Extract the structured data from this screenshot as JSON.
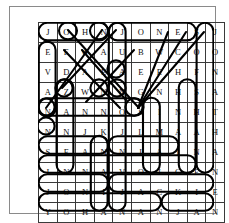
{
  "puzzle": {
    "title": "Word Search Puzzle",
    "rows": 10,
    "cols": 10,
    "grid": [
      [
        "J",
        "O",
        "H",
        "N",
        "J",
        "O",
        "N",
        "E",
        "S",
        "J"
      ],
      [
        "E",
        "E",
        "W",
        "A",
        "U",
        "B",
        "W",
        "C",
        "O",
        "O"
      ],
      [
        "V",
        "D",
        "A",
        "E",
        "A",
        "E",
        "E",
        "H",
        "F",
        "N"
      ],
      [
        "A",
        "Z",
        "W",
        "N",
        "N",
        "G",
        "N",
        "H",
        "S",
        "A"
      ],
      [
        "N",
        "A",
        "N",
        "N",
        "O",
        "S",
        "I",
        "N",
        "H",
        "T"
      ],
      [
        "N",
        "N",
        "J",
        "K",
        "J",
        "L",
        "M",
        "A",
        "A",
        "H"
      ],
      [
        "S",
        "E",
        "A",
        "N",
        "N",
        "I",
        "A",
        "I",
        "N",
        "A"
      ],
      [
        "I",
        "N",
        "N",
        "A",
        "V",
        "O",
        "I",
        "G",
        "E",
        "N"
      ],
      [
        "J",
        "O",
        "N",
        "I",
        "J",
        "A",
        "C",
        "K",
        "I",
        "E"
      ],
      [
        "Y",
        "O",
        "H",
        "A",
        "N",
        "A",
        "N",
        "J",
        "A",
        "N"
      ]
    ],
    "found_words": [
      {
        "word": "JOHN",
        "direction": "horizontal",
        "start_row": 0,
        "start_col": 0,
        "end_row": 0,
        "end_col": 3
      },
      {
        "word": "JONES",
        "direction": "horizontal",
        "start_row": 0,
        "start_col": 4,
        "end_row": 0,
        "end_col": 8
      },
      {
        "word": "JONATHAN",
        "direction": "vertical",
        "start_row": 0,
        "start_col": 9,
        "end_row": 7,
        "end_col": 9
      },
      {
        "word": "EVAN",
        "direction": "vertical",
        "start_row": 1,
        "start_col": 0,
        "end_row": 4,
        "end_col": 0
      },
      {
        "word": "SHANE",
        "direction": "vertical",
        "start_row": 3,
        "start_col": 8,
        "end_row": 7,
        "end_col": 8
      },
      {
        "word": "NANNO",
        "direction": "horizontal",
        "start_row": 4,
        "start_col": 0,
        "end_row": 4,
        "end_col": 5
      },
      {
        "word": "SEAN",
        "direction": "horizontal",
        "start_row": 6,
        "start_col": 0,
        "end_row": 6,
        "end_col": 3
      },
      {
        "word": "NIAI",
        "direction": "horizontal",
        "start_row": 6,
        "start_col": 4,
        "end_row": 6,
        "end_col": 7
      },
      {
        "word": "INNAVOIGE",
        "direction": "horizontal",
        "start_row": 7,
        "start_col": 0,
        "end_row": 7,
        "end_col": 8
      },
      {
        "word": "JONI",
        "direction": "horizontal",
        "start_row": 8,
        "start_col": 0,
        "end_row": 8,
        "end_col": 3
      },
      {
        "word": "JACKIE",
        "direction": "horizontal",
        "start_row": 8,
        "start_col": 4,
        "end_row": 8,
        "end_col": 9
      },
      {
        "word": "YOHANAN",
        "direction": "horizontal",
        "start_row": 9,
        "start_col": 0,
        "end_row": 9,
        "end_col": 6
      },
      {
        "word": "JAN",
        "direction": "horizontal",
        "start_row": 9,
        "start_col": 7,
        "end_row": 9,
        "end_col": 9
      },
      {
        "word": "ZANNA",
        "direction": "vertical",
        "start_row": 3,
        "start_col": 1,
        "end_row": 7,
        "end_col": 1
      },
      {
        "word": "NAIG",
        "direction": "vertical",
        "start_row": 4,
        "start_col": 6,
        "end_row": 7,
        "end_col": 6
      },
      {
        "word": "JOHANAN",
        "direction": "vertical",
        "start_row": 0,
        "start_col": 4,
        "end_row": 9,
        "end_col": 4
      },
      {
        "word": "JONAH-diag",
        "direction": "diagonal",
        "start_row": 0,
        "start_col": 1,
        "end_row": 4,
        "end_col": 5
      },
      {
        "word": "diag-2",
        "direction": "diagonal",
        "start_row": 0,
        "start_col": 3,
        "end_row": 4,
        "end_col": 0
      },
      {
        "word": "diag-3",
        "direction": "diagonal",
        "start_row": 0,
        "start_col": 9,
        "end_row": 4,
        "end_col": 5
      },
      {
        "word": "diag-4",
        "direction": "diagonal",
        "start_row": 0,
        "start_col": 7,
        "end_row": 4,
        "end_col": 5
      },
      {
        "word": "diag-5",
        "direction": "diagonal",
        "start_row": 0,
        "start_col": 4,
        "end_row": 3,
        "end_col": 1
      },
      {
        "word": "diag-6",
        "direction": "diagonal",
        "start_row": 1,
        "start_col": 1,
        "end_row": 5,
        "end_col": 5
      }
    ]
  },
  "colors": {
    "grid_line": "#3a3a3a",
    "letter": "#111111",
    "highlight": "#000000",
    "frame": "#8a8a8a",
    "background": "#ffffff"
  }
}
